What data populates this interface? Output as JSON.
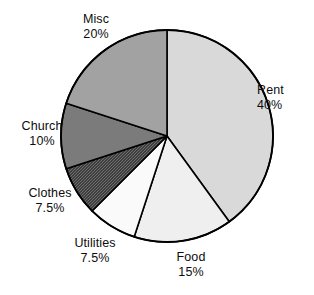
{
  "chart_data": {
    "type": "pie",
    "title": "",
    "subtitle": "",
    "xlabel": "",
    "ylabel": "",
    "legend_position": "none",
    "grid": false,
    "labels_inline": true,
    "start_angle_deg": 0,
    "direction": "clockwise",
    "categories": [
      "Rent",
      "Food",
      "Utilities",
      "Clothes",
      "Church",
      "Misc"
    ],
    "values": [
      40,
      15,
      7.5,
      7.5,
      10,
      20
    ],
    "value_unit": "%",
    "slices": [
      {
        "label": "Rent",
        "value": 40,
        "value_text": "40%",
        "fill": "#d9d9d9",
        "pattern": "solid",
        "start_deg": 0,
        "end_deg": 144
      },
      {
        "label": "Food",
        "value": 15,
        "value_text": "15%",
        "fill": "#efefef",
        "pattern": "solid",
        "start_deg": 144,
        "end_deg": 198
      },
      {
        "label": "Utilities",
        "value": 7.5,
        "value_text": "7.5%",
        "fill": "#fafafa",
        "pattern": "solid",
        "start_deg": 198,
        "end_deg": 225
      },
      {
        "label": "Clothes",
        "value": 7.5,
        "value_text": "7.5%",
        "fill": "#3f3f3f",
        "pattern": "checkered",
        "start_deg": 225,
        "end_deg": 252
      },
      {
        "label": "Church",
        "value": 10,
        "value_text": "10%",
        "fill": "#7b7b7b",
        "pattern": "solid",
        "start_deg": 252,
        "end_deg": 288
      },
      {
        "label": "Misc",
        "value": 20,
        "value_text": "20%",
        "fill": "#a2a2a2",
        "pattern": "solid",
        "start_deg": 288,
        "end_deg": 360
      }
    ],
    "geometry": {
      "center_x": 167,
      "center_y": 136,
      "radius": 106
    },
    "stroke_color": "#000000",
    "background": "#ffffff"
  }
}
